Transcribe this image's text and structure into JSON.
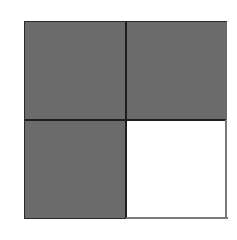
{
  "diagram": {
    "type": "fraction-grid",
    "rows": 2,
    "cols": 2,
    "cells": [
      {
        "row": 0,
        "col": 0,
        "state": "shaded"
      },
      {
        "row": 0,
        "col": 1,
        "state": "shaded"
      },
      {
        "row": 1,
        "col": 0,
        "state": "shaded"
      },
      {
        "row": 1,
        "col": 1,
        "state": "empty"
      }
    ],
    "shaded_count": 3,
    "total_count": 4,
    "colors": {
      "shaded": "#6b6b6b",
      "empty": "#ffffff",
      "border": "#1e1e1e"
    }
  }
}
